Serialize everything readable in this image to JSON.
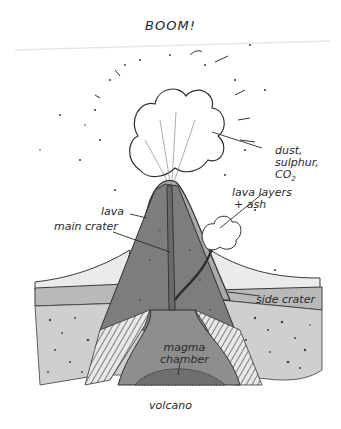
{
  "diagram": {
    "title": "BOOM!",
    "caption": "volcano",
    "labels": {
      "dust_line1": "dust,",
      "dust_line2": "sulphur,",
      "dust_line3": "CO",
      "dust_sub": "2",
      "lava_layers_line1": "lava layers",
      "lava_layers_line2": "+ ash",
      "lava": "lava",
      "main_crater": "main crater",
      "side_crater": "side crater",
      "magma_line1": "magma",
      "magma_line2": "chamber"
    },
    "colors": {
      "lava_flow": "#ebebeb",
      "ground_band": "#b9b9b9",
      "rock_light": "#cfcfcf",
      "cone_outer": "#a9a9a9",
      "cone_inner": "#7d7d7d",
      "magma": "#8e8e8e",
      "magma_core": "#6f6f6f",
      "ink": "#2a2a2a"
    }
  }
}
